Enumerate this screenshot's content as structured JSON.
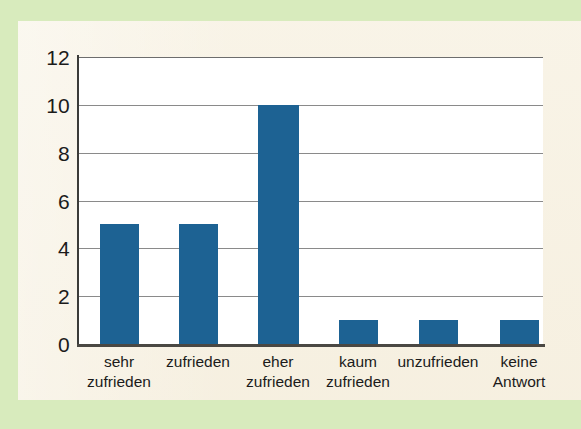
{
  "figure": {
    "border_color": "#d8ebbd",
    "panel_color": "#f7f1e2",
    "plot_background": "#ffffff"
  },
  "chart_data": {
    "type": "bar",
    "title": "",
    "subtitle": "",
    "xlabel": "",
    "ylabel": "",
    "categories": [
      "sehr zufrieden",
      "zufrieden",
      "eher zufrieden",
      "kaum zufrieden",
      "unzufrieden",
      "keine Antwort"
    ],
    "category_lines": [
      [
        "sehr",
        "zufrieden"
      ],
      [
        "zufrieden",
        ""
      ],
      [
        "eher",
        "zufrieden"
      ],
      [
        "kaum",
        "zufrieden"
      ],
      [
        "unzufrieden",
        ""
      ],
      [
        "keine",
        "Antwort"
      ]
    ],
    "values": [
      5,
      5,
      10,
      1,
      1,
      1
    ],
    "ylim": [
      0,
      12
    ],
    "yticks": [
      0,
      2,
      4,
      6,
      8,
      10,
      12
    ],
    "ytick_labels": [
      "0",
      "2",
      "4",
      "6",
      "8",
      "10",
      "12"
    ],
    "grid": true,
    "grid_axis": "y",
    "grid_color": "#8a8a8a",
    "legend": false,
    "legend_position": "none",
    "bar_color": "#1d6293",
    "axis_color": "#3b3b39"
  }
}
